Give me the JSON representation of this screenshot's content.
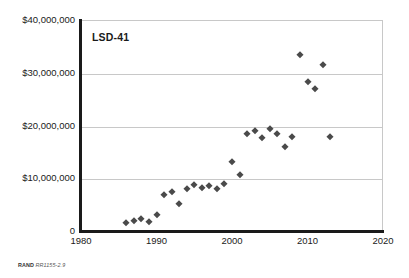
{
  "chart_data": {
    "type": "scatter",
    "title": "LSD-41",
    "xlabel": "",
    "ylabel": "",
    "xlim": [
      1980,
      2020
    ],
    "ylim": [
      0,
      40000000
    ],
    "xticks": [
      "1980",
      "1990",
      "2000",
      "2010",
      "2020"
    ],
    "xtick_values": [
      1980,
      1990,
      2000,
      2010,
      2020
    ],
    "yticks": [
      "0",
      "$10,000,000",
      "$20,000,000",
      "$30,000,000",
      "$40,000,000"
    ],
    "ytick_values": [
      0,
      10000000,
      20000000,
      30000000,
      40000000
    ],
    "grid": "horizontal",
    "legend": "none",
    "marker_shape": "diamond",
    "marker_color": "#4a4a4a",
    "series": [
      {
        "name": "LSD-41",
        "points": [
          {
            "x": 1986,
            "y": 1500000
          },
          {
            "x": 1987,
            "y": 1900000
          },
          {
            "x": 1988,
            "y": 2300000
          },
          {
            "x": 1989,
            "y": 1700000
          },
          {
            "x": 1990,
            "y": 3100000
          },
          {
            "x": 1991,
            "y": 6800000
          },
          {
            "x": 1992,
            "y": 7400000
          },
          {
            "x": 1993,
            "y": 5200000
          },
          {
            "x": 1994,
            "y": 7900000
          },
          {
            "x": 1995,
            "y": 8800000
          },
          {
            "x": 1996,
            "y": 8200000
          },
          {
            "x": 1997,
            "y": 8500000
          },
          {
            "x": 1998,
            "y": 8000000
          },
          {
            "x": 1999,
            "y": 9000000
          },
          {
            "x": 2000,
            "y": 13000000
          },
          {
            "x": 2001,
            "y": 10700000
          },
          {
            "x": 2002,
            "y": 18400000
          },
          {
            "x": 2003,
            "y": 19000000
          },
          {
            "x": 2004,
            "y": 17700000
          },
          {
            "x": 2005,
            "y": 19400000
          },
          {
            "x": 2006,
            "y": 18300000
          },
          {
            "x": 2007,
            "y": 15900000
          },
          {
            "x": 2008,
            "y": 17900000
          },
          {
            "x": 2009,
            "y": 33300000
          },
          {
            "x": 2010,
            "y": 28200000
          },
          {
            "x": 2011,
            "y": 26900000
          },
          {
            "x": 2012,
            "y": 31400000
          },
          {
            "x": 2013,
            "y": 17800000
          }
        ]
      }
    ]
  },
  "source_note": {
    "organization": "RAND",
    "reference": "RR1155-2.9"
  }
}
